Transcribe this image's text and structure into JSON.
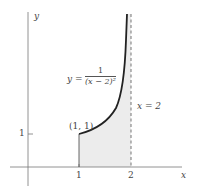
{
  "diagram": {
    "axes": {
      "x_label": "x",
      "y_label": "y",
      "x_ticks": [
        {
          "value": 1,
          "label": "1"
        },
        {
          "value": 2,
          "label": "2"
        }
      ],
      "y_ticks": [
        {
          "value": 1,
          "label": "1"
        }
      ]
    },
    "curve": {
      "equation_lhs": "y =",
      "numerator": "1",
      "denominator": "(x − 2)²",
      "color": "#222222"
    },
    "asymptote": {
      "label": "x = 2",
      "style": "dashed",
      "color": "#666666"
    },
    "point": {
      "label": "(1, 1)"
    },
    "shaded_region": {
      "description": "area under curve from x = 1 to x = 2",
      "color": "#eeeeee"
    }
  }
}
